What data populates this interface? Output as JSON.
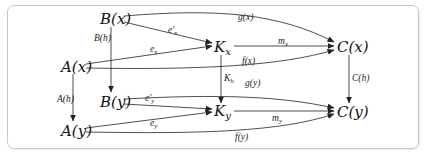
{
  "diagram": {
    "type": "commutative-diagram",
    "nodes": {
      "Bx": {
        "label": "B(x)",
        "x": 111,
        "y": 19
      },
      "Ax": {
        "label": "A(x)",
        "x": 73,
        "y": 67
      },
      "Kx": {
        "label": "K",
        "sub": "x",
        "x": 222,
        "y": 47
      },
      "Cx": {
        "label": "C(x)",
        "x": 350,
        "y": 47
      },
      "By": {
        "label": "B(y)",
        "x": 111,
        "y": 102
      },
      "Ay": {
        "label": "A(y)",
        "x": 73,
        "y": 131
      },
      "Ky": {
        "label": "K",
        "sub": "y",
        "x": 222,
        "y": 112
      },
      "Cy": {
        "label": "C(y)",
        "x": 350,
        "y": 112
      }
    },
    "edges": [
      {
        "from": "Bx",
        "to": "Cx",
        "label": "g(x)"
      },
      {
        "from": "Bx",
        "to": "Kx",
        "label": "e'x"
      },
      {
        "from": "Ax",
        "to": "Kx",
        "label": "ex"
      },
      {
        "from": "Kx",
        "to": "Cx",
        "label": "mx"
      },
      {
        "from": "Ax",
        "to": "Cx",
        "label": "f(x)"
      },
      {
        "from": "Bx",
        "to": "By",
        "label": "B(h)"
      },
      {
        "from": "Ax",
        "to": "Ay",
        "label": "A(h)"
      },
      {
        "from": "Kx",
        "to": "Ky",
        "label": "Kh"
      },
      {
        "from": "Cx",
        "to": "Cy",
        "label": "C(h)"
      },
      {
        "from": "By",
        "to": "Cy",
        "label": "g(y)"
      },
      {
        "from": "By",
        "to": "Ky",
        "label": "e'y"
      },
      {
        "from": "Ay",
        "to": "Ky",
        "label": "ey"
      },
      {
        "from": "Ky",
        "to": "Cy",
        "label": "my"
      },
      {
        "from": "Ay",
        "to": "Cy",
        "label": "f(y)"
      }
    ]
  },
  "labels": {
    "Bx": "B(x)",
    "Ax": "A(x)",
    "Kx": "K",
    "Kx_sub": "x",
    "Cx": "C(x)",
    "By": "B(y)",
    "Ay": "A(y)",
    "Ky": "K",
    "Ky_sub": "y",
    "Cy": "C(y)",
    "gx": "g(x)",
    "epx": "e′",
    "epx_sub": "x",
    "ex": "e",
    "ex_sub": "x",
    "mx": "m",
    "mx_sub": "x",
    "fx": "f(x)",
    "Bh": "B(h)",
    "Ah": "A(h)",
    "Kh": "K",
    "Kh_sub": "h",
    "Ch": "C(h)",
    "gy": "g(y)",
    "epy": "e′",
    "epy_sub": "y",
    "ey": "e",
    "ey_sub": "y",
    "my": "m",
    "my_sub": "y",
    "fy": "f(y)"
  }
}
